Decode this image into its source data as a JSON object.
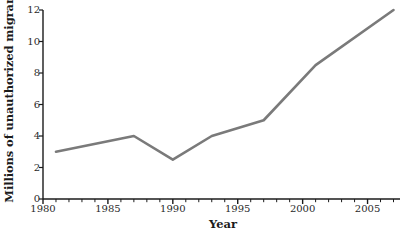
{
  "chart_data": {
    "type": "line",
    "title": "",
    "subtitle": "",
    "xlabel": "Year",
    "ylabel": "Millions of unauthorized migrants",
    "x": [
      1981,
      1987,
      1990,
      1993,
      1997,
      2001,
      2007
    ],
    "values": [
      3.0,
      4.0,
      2.5,
      4.0,
      5.0,
      8.5,
      12.0
    ],
    "series": [
      {
        "name": "Unauthorized migrants",
        "x": [
          1981,
          1987,
          1990,
          1993,
          1997,
          2001,
          2007
        ],
        "values": [
          3.0,
          4.0,
          2.5,
          4.0,
          5.0,
          8.5,
          12.0
        ]
      }
    ],
    "xlim": [
      1980,
      2007.5
    ],
    "ylim": [
      0,
      12
    ],
    "xticks": [
      1980,
      1985,
      1990,
      1995,
      2000,
      2005
    ],
    "xtick_labels": [
      "1980",
      "1985",
      "1990",
      "1995",
      "2000",
      "2005"
    ],
    "xminor_tick_interval": 1,
    "yticks": [
      0,
      2,
      4,
      6,
      8,
      10,
      12
    ],
    "ytick_labels": [
      "0",
      "2",
      "4",
      "6",
      "8",
      "10",
      "12"
    ],
    "grid": false,
    "legend": false,
    "legend_position": "none",
    "line_color": "#7a7a7a",
    "line_width": 2.6,
    "axis_color": "#1b1b1b",
    "background_color": "#ffffff",
    "text_color": "#1b1b1b",
    "annotations": []
  }
}
